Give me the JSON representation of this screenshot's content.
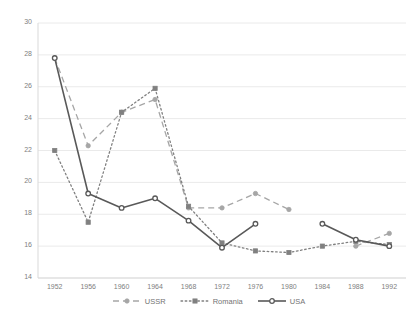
{
  "chart_data": {
    "type": "line",
    "title": "",
    "xlabel": "",
    "ylabel": "",
    "categories": [
      "1952",
      "1956",
      "1960",
      "1964",
      "1968",
      "1972",
      "1976",
      "1980",
      "1984",
      "1988",
      "1992"
    ],
    "ylim": [
      14,
      30
    ],
    "ytick_step": 2,
    "yticks": [
      "14",
      "16",
      "18",
      "20",
      "22",
      "24",
      "26",
      "28",
      "30"
    ],
    "grid": "horizontal",
    "legend_position": "bottom",
    "series": [
      {
        "name": "USSR",
        "style": "dashed",
        "color": "#a6a6a6",
        "marker": "circle-filled",
        "values": [
          27.8,
          22.3,
          24.4,
          25.2,
          18.4,
          18.4,
          19.3,
          18.3,
          null,
          16.0,
          16.8
        ]
      },
      {
        "name": "Romania",
        "style": "dotted",
        "color": "#808080",
        "marker": "square-filled",
        "values": [
          22.0,
          17.5,
          24.4,
          25.9,
          18.5,
          16.2,
          15.7,
          15.6,
          16.0,
          16.3,
          16.1
        ]
      },
      {
        "name": "USA",
        "style": "solid",
        "color": "#595959",
        "marker": "circle-open",
        "values": [
          27.8,
          19.3,
          18.4,
          19.0,
          17.6,
          15.9,
          17.4,
          null,
          17.4,
          16.4,
          16.0
        ]
      }
    ]
  },
  "legend": {
    "entries": [
      {
        "label": "USSR"
      },
      {
        "label": "Romania"
      },
      {
        "label": "USA"
      }
    ]
  },
  "watermark": {
    "line1": "",
    "line2": ""
  }
}
